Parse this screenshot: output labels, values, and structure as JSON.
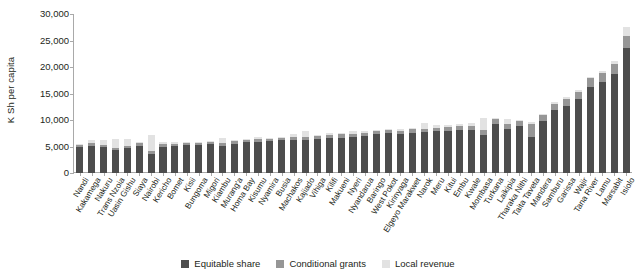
{
  "chart_data": {
    "type": "bar",
    "subtype": "stacked-bar",
    "title": "",
    "xlabel": "",
    "ylabel": "K Sh per capita",
    "ylim": [
      0,
      30000
    ],
    "yticks": [
      "0",
      "5,000",
      "10,000",
      "15,000",
      "20,000",
      "25,000",
      "30,000"
    ],
    "ytick_values": [
      0,
      5000,
      10000,
      15000,
      20000,
      25000,
      30000
    ],
    "grid": false,
    "legend_position": "bottom-center",
    "legend": [
      "Equitable share",
      "Conditional grants",
      "Local revenue"
    ],
    "colors": {
      "equitable_share": "#4d4d4d",
      "conditional_grants": "#969696",
      "local_revenue": "#e2e2e2",
      "axis": "#a9a9a9",
      "text": "#231f20",
      "background": "#ffffff"
    },
    "categories": [
      "Nandi",
      "Kakamega",
      "Nakuru",
      "Trans Nzoia",
      "Uasin Gishu",
      "Siaya",
      "Nairobi",
      "Kericho",
      "Bomet",
      "Kisii",
      "Bungoma",
      "Migori",
      "Kiambu",
      "Murang'a",
      "Homa Bay",
      "Kisumu",
      "Nyamira",
      "Busia",
      "Machakos",
      "Kajiado",
      "Vihiga",
      "Kilifi",
      "Makueni",
      "Nyeri",
      "Nyandarua",
      "Baringo",
      "West Pokot",
      "Kirinyaga",
      "Elgeyo Marakwet",
      "Narok",
      "Meru",
      "Kitui",
      "Embu",
      "Kwale",
      "Mombasa",
      "Turkana",
      "Laikipia",
      "Tharaka Nithi",
      "Taita Taveta",
      "Mandera",
      "Samburu",
      "Garissa",
      "Wajir",
      "Tana River",
      "Lamu",
      "Marsabit",
      "Isiolo"
    ],
    "series": [
      {
        "name": "Equitable share",
        "key": "equitable_share",
        "values": [
          4950,
          5050,
          4900,
          4300,
          4650,
          5150,
          3500,
          5000,
          5100,
          5200,
          5250,
          5450,
          5100,
          5550,
          5800,
          5900,
          5950,
          6150,
          6250,
          6300,
          6500,
          6600,
          6700,
          6800,
          7000,
          7300,
          7500,
          7300,
          7600,
          7700,
          7850,
          8000,
          8100,
          8200,
          7200,
          9300,
          8300,
          8900,
          6800,
          9900,
          11800,
          12700,
          13900,
          16300,
          17200,
          18700,
          23500
        ]
      },
      {
        "name": "Conditional grants",
        "key": "conditional_grants",
        "values": [
          350,
          550,
          400,
          350,
          400,
          450,
          700,
          450,
          400,
          450,
          400,
          450,
          500,
          450,
          450,
          500,
          500,
          500,
          550,
          500,
          550,
          550,
          600,
          600,
          600,
          600,
          600,
          650,
          650,
          650,
          650,
          700,
          700,
          750,
          900,
          800,
          900,
          900,
          2400,
          1000,
          1200,
          1300,
          1400,
          1600,
          1700,
          1900,
          2300
        ]
      },
      {
        "name": "Local revenue",
        "key": "local_revenue",
        "values": [
          200,
          700,
          900,
          1700,
          1350,
          250,
          2900,
          350,
          300,
          250,
          250,
          200,
          1000,
          300,
          200,
          350,
          200,
          200,
          500,
          1100,
          200,
          400,
          250,
          500,
          400,
          300,
          200,
          350,
          300,
          1100,
          600,
          300,
          400,
          400,
          2200,
          300,
          900,
          300,
          400,
          300,
          400,
          400,
          300,
          300,
          400,
          500,
          1800
        ]
      }
    ]
  },
  "legend": {
    "items": [
      {
        "label": "Equitable share",
        "color": "#4d4d4d"
      },
      {
        "label": "Conditional grants",
        "color": "#969696"
      },
      {
        "label": "Local revenue",
        "color": "#e2e2e2"
      }
    ]
  },
  "axis": {
    "y_title": "K Sh per capita"
  }
}
